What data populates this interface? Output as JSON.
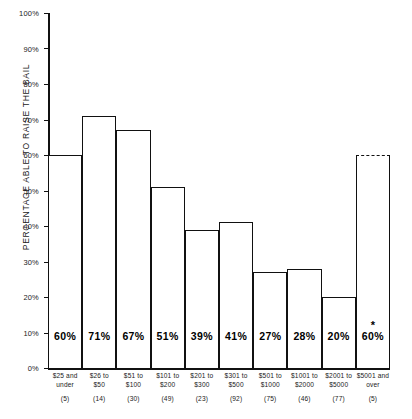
{
  "chart_data": {
    "type": "bar",
    "title": "",
    "subtitle": "",
    "xlabel": "",
    "ylabel": "PERCENTAGE ABLE TO RAISE THE BAIL",
    "ylim": [
      0,
      100
    ],
    "grid": false,
    "legend": "none",
    "y_ticks": [
      "0%",
      "10%",
      "20%",
      "30%",
      "40%",
      "50%",
      "60%",
      "70%",
      "80%",
      "90%",
      "100%"
    ],
    "y_tick_values": [
      0,
      10,
      20,
      30,
      40,
      50,
      60,
      70,
      80,
      90,
      100
    ],
    "categories": [
      "$25 and under",
      "$26 to $50",
      "$51 to $100",
      "$101 to $200",
      "$201 to $300",
      "$301 to $500",
      "$501 to $1000",
      "$1001 to $2000",
      "$2001 to $5000",
      "$5001 and over"
    ],
    "category_lines": [
      [
        "$25 and",
        "under"
      ],
      [
        "$26 to",
        "$50"
      ],
      [
        "$51 to",
        "$100"
      ],
      [
        "$101 to",
        "$200"
      ],
      [
        "$201 to",
        "$300"
      ],
      [
        "$301 to",
        "$500"
      ],
      [
        "$501 to",
        "$1000"
      ],
      [
        "$1001 to",
        "$2000"
      ],
      [
        "$2001 to",
        "$5000"
      ],
      [
        "$5001 and",
        "over"
      ]
    ],
    "values": [
      60,
      71,
      67,
      51,
      39,
      41,
      27,
      28,
      20,
      60
    ],
    "value_labels": [
      "60%",
      "71%",
      "67%",
      "51%",
      "39%",
      "41%",
      "27%",
      "28%",
      "20%",
      "60%"
    ],
    "sample_counts": [
      5,
      14,
      30,
      49,
      23,
      92,
      75,
      46,
      77,
      5
    ],
    "sample_count_labels": [
      "(5)",
      "(14)",
      "(30)",
      "(49)",
      "(23)",
      "(92)",
      "(75)",
      "(46)",
      "(77)",
      "(5)"
    ],
    "annotations": [
      {
        "category_index": 9,
        "marker": "*",
        "style": "dashed-top",
        "note": "estimate / small sample"
      }
    ],
    "colors": {
      "bar_fill": "#ffffff",
      "bar_stroke": "#111111",
      "axis": "#111111",
      "text": "#1a1a1a"
    }
  }
}
